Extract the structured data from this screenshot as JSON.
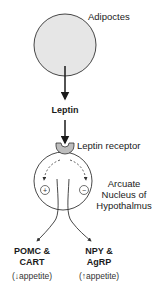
{
  "diagram": {
    "nodes": {
      "adipocytes": {
        "label": "Adipoctes"
      },
      "leptin": {
        "label": "Leptin"
      },
      "leptin_receptor": {
        "label": "Leptin receptor"
      },
      "arcuate": {
        "line1": "Arcuate",
        "line2": "Nucleus of",
        "line3": "Hypothalmus"
      },
      "pomc": {
        "line1": "POMC &",
        "line2": "CART",
        "effect": "(↓appetite)"
      },
      "npy": {
        "line1": "NPY &",
        "line2": "AgRP",
        "effect": "(↑appetite)"
      }
    },
    "symbols": {
      "plus": "+",
      "minus": "−"
    },
    "colors": {
      "cell_fill": "#e6e6e6",
      "receptor_fill": "#bdbdbd",
      "stroke": "#1a1a1a"
    }
  }
}
